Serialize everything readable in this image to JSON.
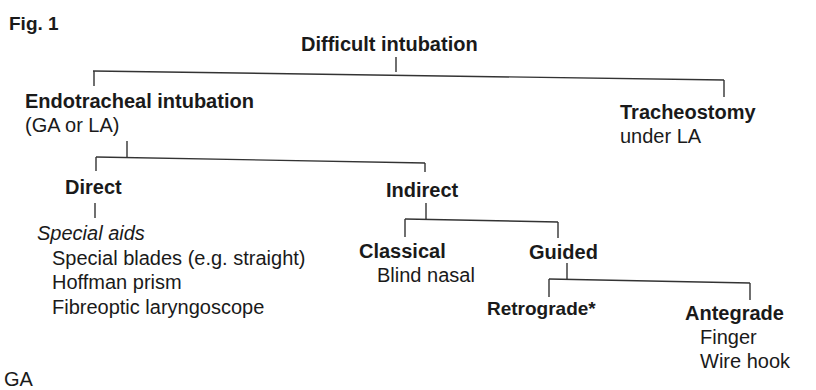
{
  "figure_label": "Fig. 1",
  "root": {
    "title": "Difficult intubation"
  },
  "endotracheal": {
    "title": "Endotracheal intubation",
    "subtitle": "(GA or LA)"
  },
  "tracheostomy": {
    "title": "Tracheostomy",
    "subtitle": "under LA"
  },
  "direct": {
    "title": "Direct",
    "aids_heading": "Special aids",
    "items": [
      "Special blades (e.g. straight)",
      "Hoffman prism",
      "Fibreoptic laryngoscope"
    ]
  },
  "indirect": {
    "title": "Indirect"
  },
  "classical": {
    "title": "Classical",
    "items": [
      "Blind nasal"
    ]
  },
  "guided": {
    "title": "Guided"
  },
  "retrograde": {
    "title": "Retrograde*"
  },
  "antegrade": {
    "title": "Antegrade",
    "items": [
      "Finger",
      "Wire hook"
    ]
  },
  "footnote_partial": "GA"
}
